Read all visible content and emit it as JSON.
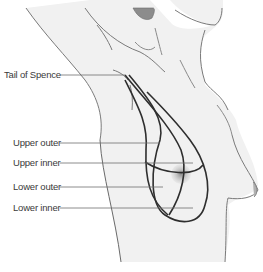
{
  "figure": {
    "labels": [
      {
        "id": "tail-of-spence",
        "text": "Tail of Spence",
        "x": 4,
        "y": 70,
        "leader_to": [
          125,
          75
        ]
      },
      {
        "id": "upper-outer",
        "text": "Upper outer",
        "x": 13,
        "y": 133,
        "leader_to": [
          160,
          143
        ]
      },
      {
        "id": "upper-inner",
        "text": "Upper inner",
        "x": 13,
        "y": 157,
        "leader_to": [
          193,
          163
        ]
      },
      {
        "id": "lower-outer",
        "text": "Lower outer",
        "x": 13,
        "y": 181,
        "leader_to": [
          163,
          187
        ]
      },
      {
        "id": "lower-inner",
        "text": "Lower inner",
        "x": 13,
        "y": 202,
        "leader_to": [
          193,
          208
        ]
      }
    ],
    "colors": {
      "skin": "#f1f1f1",
      "outline": "#7a7a7a",
      "quadrant_line": "#2e2e2e",
      "leader_line": "#6e6e6e",
      "areola": "#9a9a9a",
      "hair": "#8c8c8c",
      "text": "#3a3a3a"
    }
  }
}
